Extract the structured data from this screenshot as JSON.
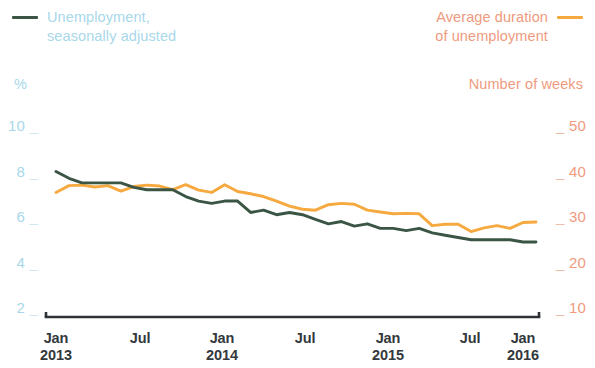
{
  "legend": {
    "left": {
      "label": "Unemployment,\nseasonally adjusted",
      "color": "#3b5545"
    },
    "right": {
      "label": "Average duration\nof unemployment",
      "color": "#f5a93f"
    }
  },
  "axis_captions": {
    "left": "%",
    "right": "Number of weeks"
  },
  "chart_data": {
    "type": "line",
    "title": "",
    "subtitle": "",
    "xlabel": "",
    "ylabel": "%",
    "y2label": "Number of weeks",
    "grid": false,
    "legend_position": "top",
    "xlim": [
      "2013-01",
      "2016-02"
    ],
    "ylim": [
      2,
      10
    ],
    "y2lim": [
      10,
      50
    ],
    "yticks": [
      "10",
      "8",
      "6",
      "4",
      "2"
    ],
    "y2ticks": [
      "50",
      "40",
      "30",
      "20",
      "10"
    ],
    "xticks": [
      "Jan\n2013",
      "Jul",
      "Jan\n2014",
      "Jul",
      "Jan\n2015",
      "Jul",
      "Jan\n2016"
    ],
    "x": [
      "2013-01",
      "2013-02",
      "2013-03",
      "2013-04",
      "2013-05",
      "2013-06",
      "2013-07",
      "2013-08",
      "2013-09",
      "2013-10",
      "2013-11",
      "2013-12",
      "2014-01",
      "2014-02",
      "2014-03",
      "2014-04",
      "2014-05",
      "2014-06",
      "2014-07",
      "2014-08",
      "2014-09",
      "2014-10",
      "2014-11",
      "2014-12",
      "2015-01",
      "2015-02",
      "2015-03",
      "2015-04",
      "2015-05",
      "2015-06",
      "2015-07",
      "2015-08",
      "2015-09",
      "2015-10",
      "2015-11",
      "2015-12",
      "2016-01",
      "2016-02"
    ],
    "series": [
      {
        "name": "Unemployment, seasonally adjusted",
        "color": "#3b5545",
        "axis": "left",
        "unit": "%",
        "values": [
          8.0,
          7.7,
          7.5,
          7.5,
          7.5,
          7.5,
          7.3,
          7.2,
          7.2,
          7.2,
          6.9,
          6.7,
          6.6,
          6.7,
          6.7,
          6.2,
          6.3,
          6.1,
          6.2,
          6.1,
          5.9,
          5.7,
          5.8,
          5.6,
          5.7,
          5.5,
          5.5,
          5.4,
          5.5,
          5.3,
          5.2,
          5.1,
          5.0,
          5.0,
          5.0,
          5.0,
          4.9,
          4.9
        ]
      },
      {
        "name": "Average duration of unemployment",
        "color": "#f5a93f",
        "axis": "right",
        "unit": "weeks",
        "values": [
          35.4,
          36.9,
          37.0,
          36.6,
          36.9,
          35.7,
          36.7,
          37.0,
          36.8,
          36.0,
          37.1,
          35.9,
          35.4,
          37.1,
          35.6,
          35.1,
          34.5,
          33.5,
          32.4,
          31.7,
          31.5,
          32.7,
          33.0,
          32.8,
          31.5,
          31.1,
          30.7,
          30.8,
          30.7,
          28.1,
          28.4,
          28.4,
          26.8,
          27.6,
          28.1,
          27.5,
          28.8,
          28.9
        ]
      }
    ]
  }
}
